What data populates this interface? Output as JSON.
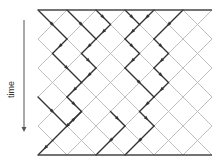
{
  "labels": {
    "time_axis": "time"
  },
  "colors": {
    "background": "#ffffff",
    "grid_line": "#b8b8b8",
    "path_line": "#333333",
    "boundary_line": "#444444",
    "arrow": "#555555"
  },
  "grid": {
    "origin_x": 38,
    "origin_y": 10,
    "unit": 14.5,
    "cols": 12,
    "rows": 10
  },
  "time_arrow": {
    "x": 24,
    "y_start": 20,
    "y_end": 132,
    "direction": "down"
  },
  "boundaries": [
    {
      "name": "top-boundary",
      "y": 10
    },
    {
      "name": "bottom-boundary",
      "y": 155
    }
  ],
  "paths": [
    [
      [
        0,
        0
      ],
      [
        2,
        2
      ],
      [
        1,
        3
      ],
      [
        3,
        5
      ],
      [
        2,
        6
      ],
      [
        3,
        7
      ],
      [
        1,
        9
      ],
      [
        0,
        10
      ]
    ],
    [
      [
        2,
        0
      ],
      [
        4,
        2
      ],
      [
        3,
        3
      ],
      [
        4,
        4
      ],
      [
        3,
        5
      ]
    ],
    [
      [
        4,
        0
      ],
      [
        5,
        1
      ],
      [
        4,
        2
      ]
    ],
    [
      [
        6,
        0
      ],
      [
        7,
        1
      ],
      [
        6,
        2
      ],
      [
        7,
        3
      ],
      [
        6,
        4
      ],
      [
        8,
        6
      ],
      [
        7,
        7
      ],
      [
        8,
        8
      ],
      [
        6,
        10
      ]
    ],
    [
      [
        8,
        0
      ],
      [
        7,
        1
      ]
    ],
    [
      [
        10,
        0
      ],
      [
        8,
        2
      ],
      [
        9,
        3
      ],
      [
        8,
        4
      ],
      [
        9,
        5
      ],
      [
        8,
        6
      ]
    ],
    [
      [
        0,
        6
      ],
      [
        2,
        8
      ],
      [
        3,
        7
      ]
    ],
    [
      [
        5,
        7
      ],
      [
        6,
        8
      ],
      [
        4,
        10
      ]
    ]
  ]
}
